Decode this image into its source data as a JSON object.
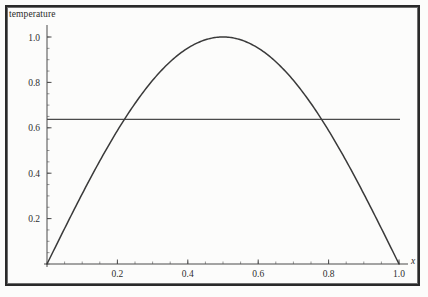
{
  "figure": {
    "axis_title_y": "temperature",
    "axis_title_x": "x",
    "frame_color": "#2a2a2a",
    "curve_color": "#3a3a3a",
    "reference_line_color": "#4a4a4a"
  },
  "chart_data": {
    "type": "line",
    "title": "",
    "subtitle": "",
    "xlabel": "x",
    "ylabel": "temperature",
    "xlim": [
      0.0,
      1.0
    ],
    "ylim": [
      0.0,
      1.05
    ],
    "grid": false,
    "legend": null,
    "xticks": [
      0.2,
      0.4,
      0.6,
      0.8,
      1.0
    ],
    "xtick_labels": [
      "0.2",
      "0.4",
      "0.6",
      "0.8",
      "1.0"
    ],
    "yticks": [
      0.2,
      0.4,
      0.6,
      0.8,
      1.0
    ],
    "ytick_labels": [
      "0.2",
      "0.4",
      "0.6",
      "0.8",
      "1.0"
    ],
    "xminor_step": 0.05,
    "yminor_step": 0.05,
    "series": [
      {
        "name": "temperature profile",
        "kind": "curve",
        "description": "sin(pi*x) temperature distribution, zero at both ends, peak 1.0 at x=0.5",
        "x": [
          0.0,
          0.05,
          0.1,
          0.15,
          0.2,
          0.25,
          0.3,
          0.35,
          0.4,
          0.45,
          0.5,
          0.55,
          0.6,
          0.65,
          0.7,
          0.75,
          0.8,
          0.85,
          0.9,
          0.95,
          1.0
        ],
        "values": [
          0.0,
          0.156,
          0.309,
          0.454,
          0.588,
          0.707,
          0.809,
          0.891,
          0.951,
          0.988,
          1.0,
          0.988,
          0.951,
          0.891,
          0.809,
          0.707,
          0.588,
          0.454,
          0.309,
          0.156,
          0.0
        ]
      },
      {
        "name": "mean temperature",
        "kind": "horizontal-line",
        "description": "constant reference level at the average of the curve, 2/pi",
        "y": 0.637,
        "x_span": [
          0.0,
          1.0
        ]
      }
    ],
    "intersections": [
      {
        "x": 0.22,
        "y": 0.637
      },
      {
        "x": 0.78,
        "y": 0.637
      }
    ]
  }
}
